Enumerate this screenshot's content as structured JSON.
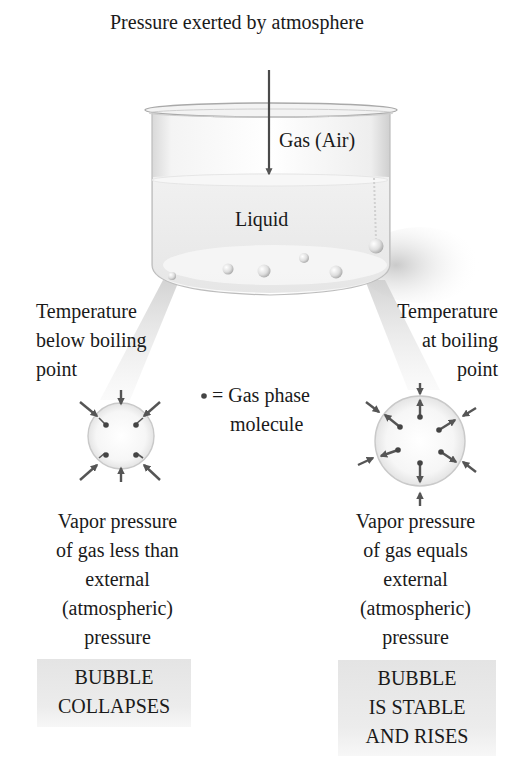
{
  "title": "Pressure exerted by atmosphere",
  "beaker": {
    "gas_label": "Gas (Air)",
    "liquid_label": "Liquid"
  },
  "legend": {
    "symbol": "•",
    "line1": "= Gas phase",
    "line2": "molecule"
  },
  "left": {
    "condition": [
      "Temperature",
      "below boiling",
      "point"
    ],
    "explanation": [
      "Vapor pressure",
      "of gas less than",
      "external",
      "(atmospheric)",
      "pressure"
    ],
    "result": [
      "BUBBLE",
      "COLLAPSES"
    ]
  },
  "right": {
    "condition": [
      "Temperature",
      "at boiling",
      "point"
    ],
    "explanation": [
      "Vapor pressure",
      "of gas equals",
      "external",
      "(atmospheric)",
      "pressure"
    ],
    "result": [
      "BUBBLE",
      "IS STABLE",
      "AND RISES"
    ]
  },
  "colors": {
    "arrow": "#555555",
    "bubble_outline": "#c8c8c8",
    "result_box": "#e6e6e6"
  }
}
